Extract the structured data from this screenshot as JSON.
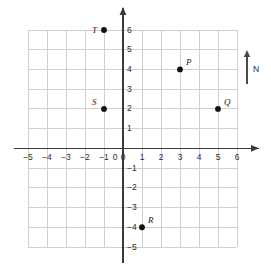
{
  "figure": {
    "type": "coordinate-plane",
    "background_color": "#ffffff",
    "grid_color": "#cfcfcf",
    "axis_color": "#3a3a3a",
    "point_color": "#111111",
    "label_color": "#1a1a1a"
  },
  "chart_data": {
    "type": "scatter",
    "title": "",
    "xlabel": "",
    "ylabel": "",
    "xlim": [
      -5.5,
      6.5
    ],
    "ylim": [
      -5.5,
      6.5
    ],
    "grid": true,
    "legend": "none",
    "x_tick_labels": [
      "−5",
      "−4",
      "−3",
      "−2",
      "−1",
      "0",
      "1",
      "2",
      "3",
      "4",
      "5",
      "6"
    ],
    "x_tick_values": [
      -5,
      -4,
      -3,
      -2,
      -1,
      0,
      1,
      2,
      3,
      4,
      5,
      6
    ],
    "y_tick_labels": [
      "6",
      "5",
      "4",
      "3",
      "2",
      "1",
      "0",
      "−1",
      "−2",
      "−3",
      "−4",
      "−5"
    ],
    "y_tick_values": [
      6,
      5,
      4,
      3,
      2,
      1,
      0,
      -1,
      -2,
      -3,
      -4,
      -5
    ],
    "points": [
      {
        "label": "P",
        "x": 3,
        "y": 4,
        "label_dx": 6,
        "label_dy": -11
      },
      {
        "label": "Q",
        "x": 5,
        "y": 2,
        "label_dx": 6,
        "label_dy": -11
      },
      {
        "label": "R",
        "x": 1,
        "y": -4,
        "label_dx": 6,
        "label_dy": -11
      },
      {
        "label": "S",
        "x": -1,
        "y": 2,
        "label_dx": -12,
        "label_dy": -11
      },
      {
        "label": "T",
        "x": -1,
        "y": 6,
        "label_dx": -12,
        "label_dy": -4
      }
    ]
  },
  "compass": {
    "label": "N",
    "icon": "north-arrow-icon"
  }
}
